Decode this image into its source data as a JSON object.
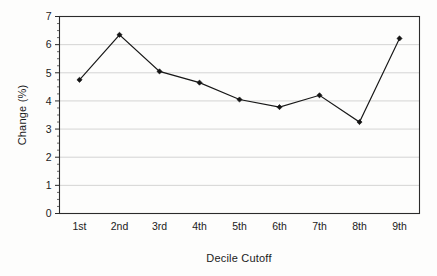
{
  "chart_data": {
    "type": "line",
    "title": "",
    "subtitle": "",
    "xlabel": "Decile Cutoff",
    "ylabel": "Change (%)",
    "categories": [
      "1st",
      "2nd",
      "3rd",
      "4th",
      "5th",
      "6th",
      "7th",
      "8th",
      "9th"
    ],
    "values": [
      4.75,
      6.35,
      5.05,
      4.65,
      4.05,
      3.78,
      4.2,
      3.25,
      6.22
    ],
    "ylim": [
      0,
      7
    ],
    "yticks": [
      "0",
      "1",
      "2",
      "3",
      "4",
      "5",
      "6",
      "7"
    ],
    "ytick_values": [
      0,
      1,
      2,
      3,
      4,
      5,
      6,
      7
    ],
    "grid": true,
    "grid_axis": "y",
    "legend": false,
    "legend_position": "none",
    "marker": "diamond",
    "series_color": "#171717",
    "grid_color": "#c9c9c9",
    "frame_color": "#2b2b2b",
    "background_color": "#fdfdfc"
  }
}
